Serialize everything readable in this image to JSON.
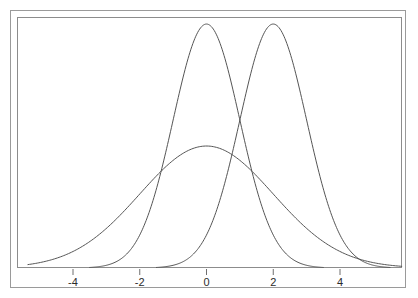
{
  "chart_data": {
    "type": "line",
    "title": "",
    "subtitle": "",
    "xlabel": "",
    "ylabel": "",
    "xlim": [
      -5.7,
      5.9
    ],
    "ylim": [
      0,
      0.42
    ],
    "grid": false,
    "legend": "none",
    "x_ticks": [
      {
        "value": -4,
        "label": "-4"
      },
      {
        "value": -2,
        "label": "-2"
      },
      {
        "value": 0,
        "label": "0"
      },
      {
        "value": 2,
        "label": "2"
      },
      {
        "value": 4,
        "label": "4"
      }
    ],
    "y_ticks": [],
    "annotations": [],
    "series": [
      {
        "name": "wide-normal-mean-0-sd-2",
        "kind": "normal-density",
        "mean": 0,
        "sd": 2,
        "peak_value": 0.199,
        "x_start": -5.35,
        "x_end": 5.85,
        "color": "#555555",
        "x": [
          -5.35,
          -5.0,
          -4.5,
          -4.0,
          -3.5,
          -3.0,
          -2.5,
          -2.0,
          -1.5,
          -1.0,
          -0.5,
          0.0,
          0.5,
          1.0,
          1.5,
          2.0,
          2.5,
          3.0,
          3.5,
          4.0,
          4.5,
          5.0,
          5.5,
          5.85
        ],
        "values": [
          0.0052,
          0.0088,
          0.013,
          0.027,
          0.0432,
          0.0648,
          0.0913,
          0.121,
          0.1506,
          0.176,
          0.1933,
          0.1995,
          0.1933,
          0.176,
          0.1506,
          0.121,
          0.0913,
          0.0648,
          0.0432,
          0.027,
          0.0158,
          0.0088,
          0.0046,
          0.003
        ]
      },
      {
        "name": "narrow-normal-mean-0-sd-1",
        "kind": "normal-density",
        "mean": 0,
        "sd": 1,
        "peak_value": 0.399,
        "x_start": -3.5,
        "x_end": 3.5,
        "color": "#555555",
        "x": [
          -3.5,
          -3.0,
          -2.5,
          -2.0,
          -1.5,
          -1.0,
          -0.5,
          0.0,
          0.5,
          1.0,
          1.5,
          2.0,
          2.5,
          3.0,
          3.5
        ],
        "values": [
          0.0009,
          0.0044,
          0.0175,
          0.054,
          0.1295,
          0.242,
          0.3521,
          0.3989,
          0.3521,
          0.242,
          0.1295,
          0.054,
          0.0175,
          0.0044,
          0.0009
        ]
      },
      {
        "name": "narrow-normal-mean-2-sd-1",
        "kind": "normal-density",
        "mean": 2,
        "sd": 1,
        "peak_value": 0.399,
        "x_start": -1.5,
        "x_end": 5.5,
        "color": "#555555",
        "x": [
          -1.5,
          -1.0,
          -0.5,
          0.0,
          0.5,
          1.0,
          1.5,
          2.0,
          2.5,
          3.0,
          3.5,
          4.0,
          4.5,
          5.0,
          5.5
        ],
        "values": [
          0.0009,
          0.0044,
          0.0175,
          0.054,
          0.1295,
          0.242,
          0.3521,
          0.3989,
          0.3521,
          0.242,
          0.1295,
          0.054,
          0.0175,
          0.0044,
          0.0009
        ]
      }
    ]
  },
  "figure": {
    "frame_color": "#9a9a9a",
    "panel_border_color": "#8c8c8c",
    "curve_color": "#555555",
    "background": "#ffffff",
    "tick_color": "#6f6f6f",
    "label_color": "#2b2b2b"
  }
}
